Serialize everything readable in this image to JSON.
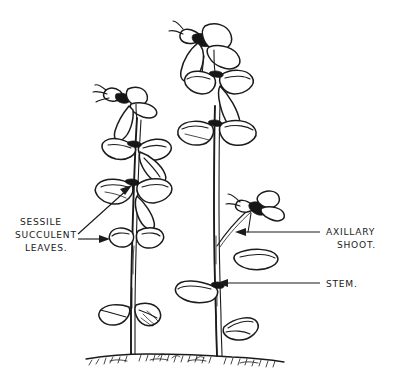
{
  "figure": {
    "type": "botanical-line-drawing",
    "background_color": "#ffffff",
    "ink_color": "#1b1b1b"
  },
  "labels": {
    "sessile_leaves": {
      "name": "sessile-succulent-leaves",
      "line1": "SESSILE",
      "line2": "SUCCULENT",
      "line3": "LEAVES.",
      "position": "left",
      "leader_count": 2
    },
    "axillary_shoot": {
      "name": "axillary-shoot",
      "line1": "AXILLARY",
      "line2": "SHOOT.",
      "position": "right",
      "leader_count": 1
    },
    "stem": {
      "name": "stem",
      "line1": "STEM.",
      "position": "right",
      "leader_count": 1
    }
  },
  "plants": [
    {
      "name": "left-plant",
      "has_terminal_flower": true,
      "leaf_pair_count": 4,
      "description": "Shorter shoot with terminal flower and opposite rounded succulent leaves"
    },
    {
      "name": "right-plant",
      "has_terminal_flower": true,
      "leaf_pair_count": 4,
      "has_axillary_shoot": true,
      "description": "Taller shoot with large terminal flower head and a lateral axillary shoot bearing a bud"
    }
  ],
  "ground": {
    "name": "soil-line",
    "description": "Stippled soil surface from which both stems emerge"
  }
}
